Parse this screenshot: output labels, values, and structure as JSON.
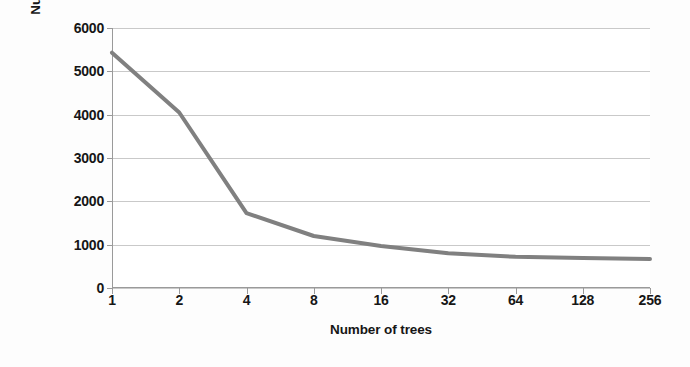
{
  "chart_data": {
    "type": "line",
    "title": "",
    "xlabel": "Number of trees",
    "ylabel": "Number of misclassification",
    "categories": [
      "1",
      "2",
      "4",
      "8",
      "16",
      "32",
      "64",
      "128",
      "256"
    ],
    "x": [
      1,
      2,
      4,
      8,
      16,
      32,
      64,
      128,
      256
    ],
    "values": [
      5430,
      4050,
      1730,
      1200,
      970,
      800,
      720,
      690,
      670
    ],
    "series": [
      {
        "name": "Number of misclassification",
        "values": [
          5430,
          4050,
          1730,
          1200,
          970,
          800,
          720,
          690,
          670
        ]
      }
    ],
    "ylim": [
      0,
      6000
    ],
    "ytick_labels": [
      "0",
      "1000",
      "2000",
      "3000",
      "4000",
      "5000",
      "6000"
    ],
    "ytick_values": [
      0,
      1000,
      2000,
      3000,
      4000,
      5000,
      6000
    ],
    "grid": true,
    "grid_axis": "y",
    "legend": false,
    "x_scale": "log2-categorical",
    "line_color": "#808080",
    "grid_color": "#c9c9c9",
    "axis_color": "#9a9a9a",
    "text_color": "#161616",
    "background_color": "#ffffff",
    "line_width": 4
  }
}
